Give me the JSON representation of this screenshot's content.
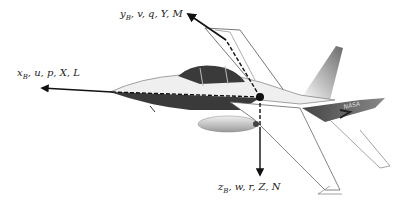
{
  "diagram": {
    "origin": {
      "x": 260,
      "y": 97
    },
    "axes": [
      {
        "id": "x",
        "symbol": "x",
        "subscript": "B",
        "rest": ", u, p, X, L",
        "direction": "forward (nose)"
      },
      {
        "id": "y",
        "symbol": "y",
        "subscript": "B",
        "rest": ", v, q, Y, M",
        "direction": "right wing"
      },
      {
        "id": "z",
        "symbol": "z",
        "subscript": "B",
        "rest": ", w, r, Z, N",
        "direction": "down"
      }
    ],
    "tail_marking": "NASA",
    "colors": {
      "axis": "#111111",
      "fuselage_dark": "#3a3a3a",
      "fuselage_light": "#e8e8e8",
      "outline": "#555555"
    }
  }
}
